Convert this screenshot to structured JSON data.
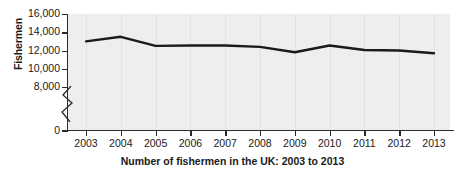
{
  "chart_data": {
    "type": "line",
    "title": "Number of fishermen in the UK: 2003 to 2013",
    "xlabel": "",
    "ylabel": "Fishermen",
    "categories": [
      "2003",
      "2004",
      "2005",
      "2006",
      "2007",
      "2008",
      "2009",
      "2010",
      "2011",
      "2012",
      "2013"
    ],
    "values": [
      13000,
      13500,
      12500,
      12550,
      12550,
      12400,
      11800,
      12550,
      12050,
      12000,
      11700
    ],
    "series": [
      {
        "name": "Fishermen",
        "values": [
          13000,
          13500,
          12500,
          12550,
          12550,
          12400,
          11800,
          12550,
          12050,
          12000,
          11700
        ]
      }
    ],
    "ylim": [
      0,
      16000
    ],
    "yticks": [
      0,
      8000,
      10000,
      12000,
      14000,
      16000
    ],
    "ytick_labels": [
      "0",
      "8,000",
      "10,000",
      "12,000",
      "14,000",
      "16,000"
    ],
    "axis_break": true,
    "axis_break_between": [
      0,
      8000
    ],
    "grid": "vertical",
    "legend": "none",
    "line_color": "#1a1a1a",
    "plot_background": "#eeeeee",
    "page_background": "#ffffff"
  }
}
